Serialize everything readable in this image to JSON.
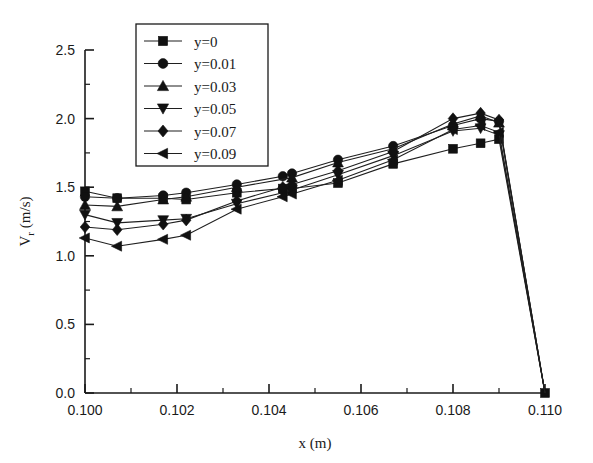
{
  "chart_data": {
    "type": "line",
    "title": "",
    "xlabel": "x (m)",
    "ylabel": "V r (m/s)",
    "ylabel_base": "V",
    "ylabel_sub": "r",
    "ylabel_unit": "(m/s)",
    "xlim": [
      0.1,
      0.11
    ],
    "ylim": [
      0.0,
      2.5
    ],
    "grid": false,
    "legend_position": "top-left-inside",
    "x_ticks": [
      "0.100",
      "0.102",
      "0.104",
      "0.106",
      "0.108",
      "0.110"
    ],
    "x_tick_values": [
      0.1,
      0.102,
      0.104,
      0.106,
      0.108,
      0.11
    ],
    "x_minor_values": [
      0.101,
      0.103,
      0.105,
      0.107,
      0.109
    ],
    "y_ticks": [
      "0.0",
      "0.5",
      "1.0",
      "1.5",
      "2.0",
      "2.5"
    ],
    "y_tick_values": [
      0.0,
      0.5,
      1.0,
      1.5,
      2.0,
      2.5
    ],
    "y_minor_values": [
      0.25,
      0.75,
      1.25,
      1.75,
      2.25
    ],
    "series": [
      {
        "name": "y=0",
        "marker": "square",
        "x": [
          0.1,
          0.1007,
          0.1017,
          0.1022,
          0.1033,
          0.1043,
          0.1045,
          0.1055,
          0.1067,
          0.108,
          0.1086,
          0.109,
          0.11
        ],
        "values": [
          1.47,
          1.42,
          1.42,
          1.41,
          1.46,
          1.49,
          1.49,
          1.53,
          1.67,
          1.78,
          1.82,
          1.85,
          0.0
        ]
      },
      {
        "name": "y=0.01",
        "marker": "circle",
        "x": [
          0.1,
          0.1007,
          0.1017,
          0.1022,
          0.1033,
          0.1043,
          0.1045,
          0.1055,
          0.1067,
          0.108,
          0.1086,
          0.109,
          0.11
        ],
        "values": [
          1.43,
          1.42,
          1.44,
          1.46,
          1.52,
          1.58,
          1.6,
          1.7,
          1.8,
          1.95,
          2.0,
          1.98,
          0.0
        ]
      },
      {
        "name": "y=0.03",
        "marker": "triangle-up",
        "x": [
          0.1,
          0.1007,
          0.1017,
          0.1022,
          0.1033,
          0.1045,
          0.1055,
          0.1067,
          0.108,
          0.1086,
          0.109,
          0.11
        ],
        "values": [
          1.37,
          1.36,
          1.41,
          1.43,
          1.5,
          1.57,
          1.68,
          1.78,
          1.96,
          2.02,
          1.97,
          0.0
        ]
      },
      {
        "name": "y=0.05",
        "marker": "triangle-down",
        "x": [
          0.1,
          0.1007,
          0.1017,
          0.1022,
          0.1033,
          0.1043,
          0.1045,
          0.1055,
          0.1067,
          0.108,
          0.1086,
          0.109,
          0.11
        ],
        "values": [
          1.3,
          1.24,
          1.26,
          1.27,
          1.38,
          1.46,
          1.48,
          1.59,
          1.73,
          1.91,
          1.93,
          1.88,
          0.0
        ]
      },
      {
        "name": "y=0.07",
        "marker": "diamond",
        "x": [
          0.1,
          0.1007,
          0.1017,
          0.1022,
          0.1033,
          0.1043,
          0.1045,
          0.1055,
          0.1067,
          0.108,
          0.1086,
          0.109,
          0.11
        ],
        "values": [
          1.21,
          1.19,
          1.23,
          1.26,
          1.4,
          1.5,
          1.52,
          1.62,
          1.76,
          2.0,
          2.04,
          1.99,
          0.0
        ]
      },
      {
        "name": "y=0.09",
        "marker": "triangle-left",
        "x": [
          0.1,
          0.1007,
          0.1017,
          0.1022,
          0.1033,
          0.1043,
          0.1045,
          0.1055,
          0.1067,
          0.108,
          0.1086,
          0.109,
          0.11
        ],
        "values": [
          1.13,
          1.07,
          1.12,
          1.15,
          1.34,
          1.43,
          1.45,
          1.55,
          1.7,
          1.92,
          1.95,
          1.9,
          0.0
        ]
      }
    ]
  }
}
